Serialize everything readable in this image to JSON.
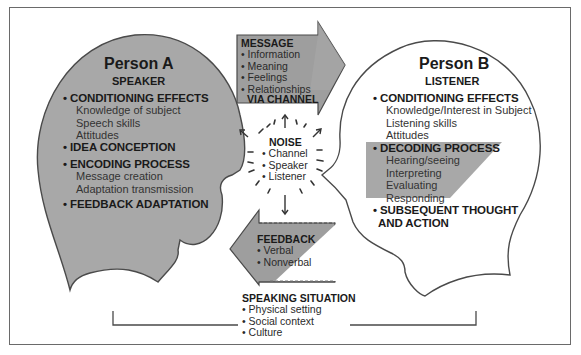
{
  "person_a": {
    "title": "Person A",
    "role": "SPEAKER",
    "sections": [
      {
        "heading": "• CONDITIONING EFFECTS",
        "items": [
          "Knowledge of subject",
          "Speech skills",
          "Attitudes"
        ]
      },
      {
        "heading": "• IDEA CONCEPTION",
        "items": []
      },
      {
        "heading": "• ENCODING PROCESS",
        "items": [
          "Message creation",
          "Adaptation transmission"
        ]
      },
      {
        "heading": "• FEEDBACK ADAPTATION",
        "items": []
      }
    ]
  },
  "person_b": {
    "title": "Person B",
    "role": "LISTENER",
    "sections": [
      {
        "heading": "• CONDITIONING EFFECTS",
        "items": [
          "Knowledge/Interest in Subject",
          "Listening skills",
          "Attitudes"
        ]
      },
      {
        "heading": "• DECODING PROCESS",
        "items": [
          "Hearing/seeing",
          "Interpreting",
          "Evaluating",
          "Responding"
        ]
      },
      {
        "heading": "• SUBSEQUENT THOUGHT",
        "heading2": "AND ACTION",
        "items": []
      }
    ]
  },
  "message_arrow": {
    "heading": "MESSAGE",
    "items": [
      "Information",
      "Meaning",
      "Feelings",
      "Relationships"
    ],
    "footer": "VIA CHANNEL"
  },
  "noise": {
    "heading": "NOISE",
    "items": [
      "Channel",
      "Speaker",
      "Listener"
    ]
  },
  "feedback_arrow": {
    "heading": "FEEDBACK",
    "items": [
      "Verbal",
      "Nonverbal"
    ]
  },
  "speaking_situation": {
    "heading": "SPEAKING SITUATION",
    "items": [
      "Physical setting",
      "Social context",
      "Culture"
    ]
  },
  "colors": {
    "head_fill": "#a8a8a8",
    "outline": "#4a4a4a",
    "arrow_fill": "#9e9e9e",
    "background": "#ffffff"
  }
}
